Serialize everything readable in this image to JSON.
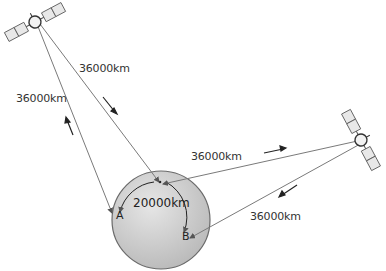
{
  "diagram": {
    "labels": {
      "top_left_link": "36000km",
      "left_link": "36000km",
      "right_upper_link": "36000km",
      "right_lower_link": "36000km",
      "surface_arc": "20000km",
      "point_a": "A",
      "point_b": "B"
    },
    "colors": {
      "line": "#7a7a7a",
      "arrow": "#222222",
      "earth_fill": "#d4d4d4",
      "earth_stroke": "#6a6a6a",
      "panel_fill": "#e8e8e8",
      "panel_stroke": "#555555"
    }
  }
}
